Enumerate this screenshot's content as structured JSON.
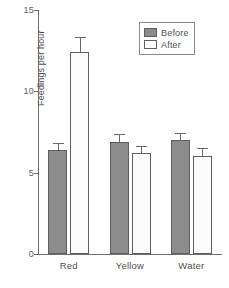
{
  "chart_data": {
    "type": "bar",
    "title": "",
    "xlabel": "",
    "ylabel": "Feedings per hour",
    "categories": [
      "Red",
      "Yellow",
      "Water"
    ],
    "ylim": [
      0,
      15
    ],
    "yticks": [
      0,
      5,
      10,
      15
    ],
    "ytick_labels": [
      "0",
      "5",
      "10",
      "15"
    ],
    "grid": false,
    "legend_position": "top-right",
    "series": [
      {
        "name": "Before",
        "color": "#8c8c8c",
        "values": [
          6.4,
          6.9,
          7.0
        ],
        "errors": [
          0.45,
          0.5,
          0.45
        ]
      },
      {
        "name": "After",
        "color": "#ffffff",
        "values": [
          12.4,
          6.2,
          6.05
        ],
        "errors": [
          0.95,
          0.45,
          0.45
        ]
      }
    ]
  },
  "legend": {
    "entries": [
      {
        "label": "Before",
        "swatch": "before"
      },
      {
        "label": "After",
        "swatch": "after"
      }
    ]
  }
}
